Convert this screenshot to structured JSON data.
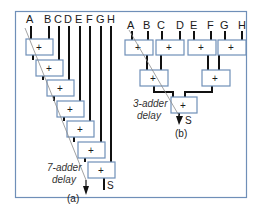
{
  "colors": {
    "frame": "#6f8fb8",
    "box_fill": "#ffffff",
    "box_stroke": "#6f8fb8",
    "wire": "#111111",
    "delay_line": "#8a8a8a"
  },
  "panel_a": {
    "inputs": [
      "A",
      "B",
      "C",
      "D",
      "E",
      "F",
      "G",
      "H"
    ],
    "adder_symbol": "+",
    "adder_count": 7,
    "output": "S",
    "delay_label_1": "7-adder",
    "delay_label_2": "delay",
    "caption": "(a)"
  },
  "panel_b": {
    "inputs": [
      "A",
      "B",
      "C",
      "D",
      "E",
      "F",
      "G",
      "H"
    ],
    "adder_symbol": "+",
    "adder_count": 7,
    "output": "S",
    "delay_label_1": "3-adder",
    "delay_label_2": "delay",
    "caption": "(b)"
  }
}
